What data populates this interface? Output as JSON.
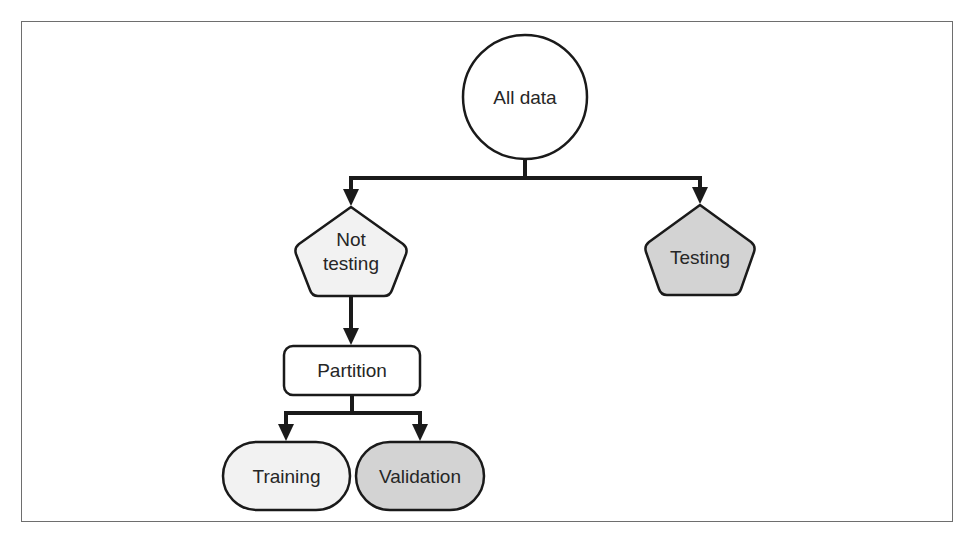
{
  "colors": {
    "stroke": "#1a1a1a",
    "frame": "#6e6e6e",
    "light_fill": "#f2f2f2",
    "dark_fill": "#d3d3d3",
    "white_fill": "#ffffff",
    "text": "#262626"
  },
  "nodes": {
    "all_data": {
      "label": "All data",
      "shape": "circle"
    },
    "not_testing": {
      "label_line1": "Not",
      "label_line2": "testing",
      "shape": "pentagon"
    },
    "testing": {
      "label": "Testing",
      "shape": "pentagon"
    },
    "partition": {
      "label": "Partition",
      "shape": "rounded-rect"
    },
    "training": {
      "label": "Training",
      "shape": "pill"
    },
    "validation": {
      "label": "Validation",
      "shape": "pill"
    }
  },
  "edges": [
    {
      "from": "All data",
      "to": "Not testing"
    },
    {
      "from": "All data",
      "to": "Testing"
    },
    {
      "from": "Not testing",
      "to": "Partition"
    },
    {
      "from": "Partition",
      "to": "Training"
    },
    {
      "from": "Partition",
      "to": "Validation"
    }
  ]
}
